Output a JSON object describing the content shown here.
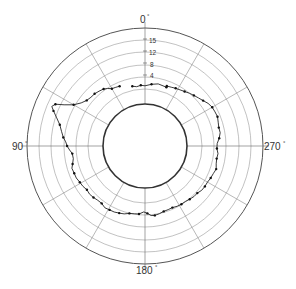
{
  "chart_data": {
    "type": "line",
    "subtype": "polar",
    "title": "",
    "angle_labels": [
      {
        "angle": 0,
        "text": "0°"
      },
      {
        "angle": 90,
        "text": "90°"
      },
      {
        "angle": 180,
        "text": "180°"
      },
      {
        "angle": 270,
        "text": "270°"
      }
    ],
    "angle_direction": "counterclockwise from top",
    "radial_tick_labels": [
      "4",
      "8",
      "12",
      "15"
    ],
    "radial_ticks": [
      4,
      8,
      12,
      16
    ],
    "radial_range": [
      0,
      20
    ],
    "grid": {
      "rings": 7,
      "spokes_every_deg": 30
    },
    "series": [
      {
        "name": "profile",
        "marker": "dot",
        "segments": [
          [
            [
              -20,
              1.2
            ],
            [
              -12,
              1.5
            ],
            [
              -6,
              1.0
            ],
            [
              0,
              0.4
            ],
            [
              4,
              0.6
            ],
            [
              8,
              0.3
            ],
            [
              12,
              0.7
            ]
          ],
          [
            [
              23,
              2.0
            ],
            [
              27,
              2.2
            ],
            [
              30,
              2.4
            ],
            [
              33,
              3.2
            ],
            [
              36,
              3.8
            ],
            [
              40,
              4.2
            ],
            [
              44,
              4.5
            ],
            [
              48,
              4.6
            ],
            [
              52,
              5.0
            ],
            [
              56,
              6.0
            ],
            [
              60,
              7.8
            ],
            [
              63,
              10.6
            ],
            [
              65,
              13.3
            ],
            [
              67,
              14.1
            ],
            [
              69,
              13.0
            ],
            [
              72,
              11.4
            ],
            [
              76,
              9.6
            ],
            [
              80,
              8.6
            ],
            [
              84,
              7.7
            ],
            [
              87,
              6.8
            ],
            [
              90,
              6.3
            ],
            [
              93,
              5.5
            ],
            [
              96,
              4.7
            ],
            [
              100,
              4.6
            ],
            [
              104,
              5.2
            ],
            [
              107,
              5.8
            ],
            [
              111,
              5.6
            ],
            [
              115,
              5.6
            ],
            [
              119,
              5.2
            ],
            [
              123,
              5.0
            ],
            [
              127,
              4.6
            ],
            [
              131,
              4.8
            ],
            [
              135,
              4.6
            ],
            [
              139,
              4.3
            ],
            [
              143,
              4.3
            ],
            [
              147,
              4.9
            ],
            [
              151,
              4.7
            ],
            [
              155,
              4.6
            ],
            [
              159,
              4.3
            ],
            [
              163,
              4.0
            ],
            [
              167,
              3.4
            ],
            [
              171,
              3.2
            ],
            [
              175,
              3.1
            ],
            [
              179,
              2.3
            ],
            [
              182,
              2.8
            ],
            [
              185,
              3.6
            ],
            [
              188,
              3.7
            ],
            [
              192,
              3.4
            ],
            [
              196,
              3.0
            ],
            [
              200,
              2.9
            ],
            [
              204,
              2.8
            ],
            [
              208,
              3.1
            ],
            [
              212,
              3.2
            ],
            [
              216,
              3.2
            ],
            [
              220,
              3.5
            ],
            [
              224,
              3.8
            ],
            [
              228,
              3.8
            ],
            [
              232,
              4.3
            ],
            [
              236,
              4.4
            ],
            [
              240,
              4.4
            ],
            [
              244,
              4.7
            ],
            [
              248,
              4.9
            ],
            [
              252,
              5.3
            ],
            [
              256,
              4.8
            ],
            [
              260,
              4.6
            ],
            [
              264,
              4.8
            ],
            [
              268,
              4.3
            ],
            [
              272,
              4.4
            ],
            [
              276,
              5.2
            ],
            [
              280,
              5.8
            ],
            [
              284,
              5.7
            ],
            [
              288,
              6.0
            ],
            [
              292,
              6.4
            ],
            [
              296,
              6.3
            ],
            [
              300,
              6.2
            ],
            [
              304,
              5.7
            ],
            [
              308,
              4.9
            ],
            [
              312,
              4.3
            ],
            [
              316,
              3.8
            ],
            [
              320,
              3.3
            ],
            [
              324,
              2.8
            ],
            [
              328,
              2.4
            ],
            [
              332,
              2.1
            ],
            [
              336,
              1.8
            ],
            [
              340,
              1.6
            ]
          ]
        ]
      }
    ]
  },
  "labels": {
    "top": "0",
    "left": "90",
    "right": "270",
    "bottom": "180",
    "degree": "°",
    "tick_15": "15",
    "tick_12": "12",
    "tick_8": "8",
    "tick_4": "4"
  }
}
